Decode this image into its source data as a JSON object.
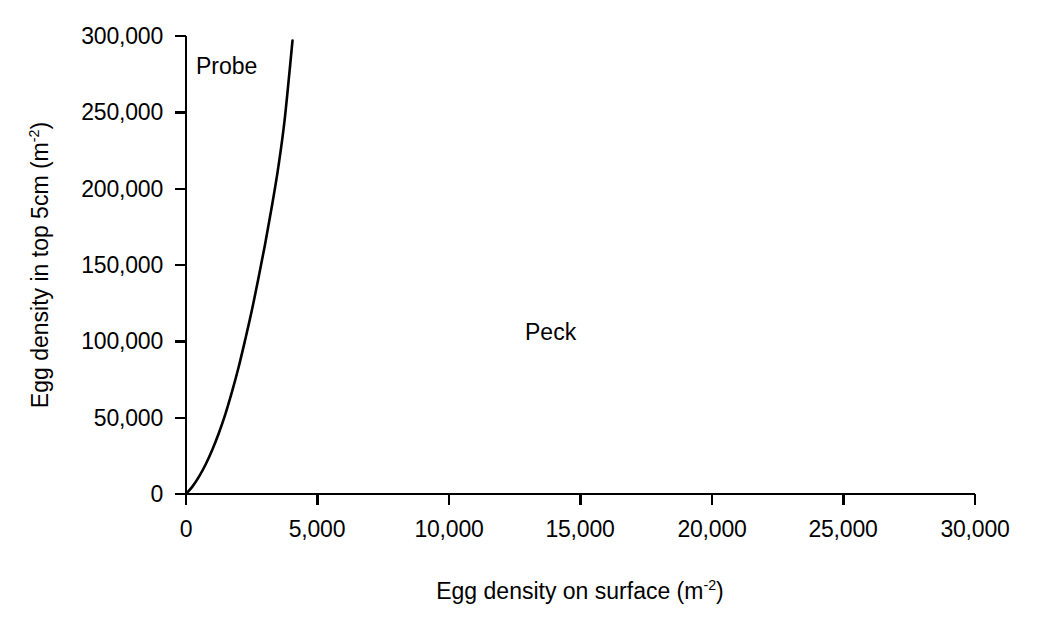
{
  "chart_data": {
    "type": "line",
    "title": "",
    "subtitle": "",
    "xlabel": "Egg density on surface (m-2)",
    "xlabel_base": "Egg density on surface (m",
    "xlabel_exponent": "-2",
    "xlabel_tail": ")",
    "ylabel": "Egg density in top 5cm (m-2)",
    "ylabel_base": "Egg density in top 5cm (m",
    "ylabel_exponent": "-2",
    "ylabel_tail": ")",
    "xlim": [
      0,
      30000
    ],
    "ylim": [
      0,
      300000
    ],
    "xticks": [
      0,
      5000,
      10000,
      15000,
      20000,
      25000,
      30000
    ],
    "yticks": [
      0,
      50000,
      100000,
      150000,
      200000,
      250000,
      300000
    ],
    "xtick_labels": [
      "0",
      "5,000",
      "10,000",
      "15,000",
      "20,000",
      "25,000",
      "30,000"
    ],
    "ytick_labels": [
      "0",
      "50,000",
      "100,000",
      "150,000",
      "200,000",
      "250,000",
      "300,000"
    ],
    "grid": false,
    "legend_position": "none",
    "line_color": "#000000",
    "axis_color": "#000000",
    "background_color": "#ffffff",
    "annotations": [
      {
        "text": "Probe",
        "x": 700,
        "y": 283000
      },
      {
        "text": "Peck",
        "x": 12900,
        "y": 113000
      }
    ],
    "series": [
      {
        "name": "Probe",
        "x": [
          0,
          250,
          500,
          750,
          1000,
          1250,
          1500,
          1750,
          2000,
          2250,
          2500,
          2750,
          3000,
          3250,
          3500,
          3750,
          4050
        ],
        "values": [
          0,
          5000,
          11500,
          19500,
          29000,
          40000,
          52500,
          67000,
          83000,
          101000,
          120000,
          141000,
          163000,
          187000,
          213000,
          245000,
          297000
        ]
      }
    ]
  },
  "annotations": {
    "probe_label": "Probe",
    "peck_label": "Peck"
  },
  "axes": {
    "x_title_base": "Egg density on surface (m",
    "x_title_sup": "-2",
    "x_title_tail": ")",
    "y_title_base": "Egg density in top 5cm (m",
    "y_title_sup": "-2",
    "y_title_tail": ")"
  }
}
